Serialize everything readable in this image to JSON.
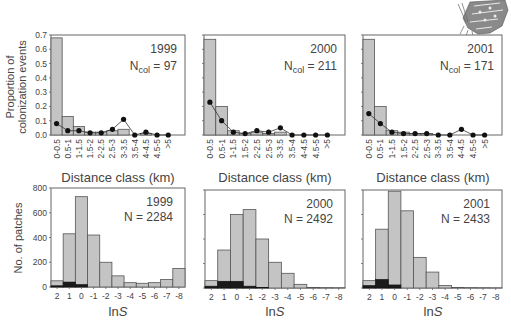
{
  "figure": {
    "top_row_ylabel_line1": "Proportion of",
    "top_row_ylabel_line2": "colonization events",
    "top_row_xlabel": "Distance class (km)",
    "bottom_row_ylabel": "No. of patches",
    "bottom_row_xlabel_prefix": "ln",
    "bottom_row_xlabel_var": "S",
    "decoration": "butterfly-illustration"
  },
  "chart_data": [
    {
      "type": "bar",
      "title": "1999",
      "annotation": "N_col = 97",
      "annotation_main": "N",
      "annotation_sub": "col",
      "annotation_value": "= 97",
      "xlabel": "Distance class (km)",
      "ylabel": "Proportion of colonization events",
      "ylim": [
        0,
        0.7
      ],
      "yticks": [
        "0.0",
        "0.1",
        "0.2",
        "0.3",
        "0.4",
        "0.5",
        "0.6",
        "0.7"
      ],
      "categories": [
        "0-0.5",
        "0.5-1",
        "1-1.5",
        "1.5-2",
        "2-2.5",
        "2.5-3",
        "3-3.5",
        "3.5-4",
        "4-4.5",
        "4.5-5",
        ">5"
      ],
      "series": [
        {
          "name": "observed colonizations (bars)",
          "values": [
            0.68,
            0.13,
            0.06,
            0.02,
            0.02,
            0.03,
            0.04,
            0.0,
            0.01,
            0.0,
            0.0
          ]
        },
        {
          "name": "expected (line with dots)",
          "values": [
            0.08,
            0.03,
            0.03,
            0.015,
            0.015,
            0.04,
            0.11,
            0.0,
            0.02,
            0.0,
            0.0
          ]
        }
      ]
    },
    {
      "type": "bar",
      "title": "2000",
      "annotation": "N_col = 211",
      "annotation_main": "N",
      "annotation_sub": "col",
      "annotation_value": "= 211",
      "xlabel": "Distance class (km)",
      "ylim": [
        0,
        0.7
      ],
      "categories": [
        "0-0.5",
        "0.5-1",
        "1-1.5",
        "1.5-2",
        "2-2.5",
        "2.5-3",
        "3-3.5",
        "3.5-4",
        "4-4.5",
        "4.5-5",
        ">5"
      ],
      "series": [
        {
          "name": "observed colonizations (bars)",
          "values": [
            0.67,
            0.2,
            0.03,
            0.01,
            0.02,
            0.01,
            0.02,
            0.0,
            0.0,
            0.0,
            0.0
          ]
        },
        {
          "name": "expected (line with dots)",
          "values": [
            0.23,
            0.1,
            0.02,
            0.01,
            0.03,
            0.02,
            0.05,
            0.0,
            0.0,
            0.0,
            0.0
          ]
        }
      ]
    },
    {
      "type": "bar",
      "title": "2001",
      "annotation": "N_col = 171",
      "annotation_main": "N",
      "annotation_sub": "col",
      "annotation_value": "= 171",
      "xlabel": "Distance class (km)",
      "ylim": [
        0,
        0.7
      ],
      "categories": [
        "0-0.5",
        "0.5-1",
        "1-1.5",
        "1.5-2",
        "2-2.5",
        "2.5-3",
        "3-3.5",
        "3.5-4",
        "4-4.5",
        "4.5-5",
        ">5"
      ],
      "series": [
        {
          "name": "observed colonizations (bars)",
          "values": [
            0.67,
            0.2,
            0.03,
            0.02,
            0.01,
            0.01,
            0.0,
            0.0,
            0.0,
            0.0,
            0.0
          ]
        },
        {
          "name": "expected (line with dots)",
          "values": [
            0.15,
            0.08,
            0.02,
            0.01,
            0.01,
            0.01,
            0.0,
            0.0,
            0.04,
            0.0,
            0.0
          ]
        }
      ]
    },
    {
      "type": "bar",
      "stacked": true,
      "title": "1999",
      "annotation": "N = 2284",
      "xlabel": "lnS",
      "ylabel": "No. of patches",
      "ylim": [
        0,
        800
      ],
      "yticks": [
        "0",
        "200",
        "400",
        "600",
        "800"
      ],
      "categories": [
        "2",
        "1",
        "0",
        "-1",
        "-2",
        "-3",
        "-4",
        "-5",
        "-6",
        "-7",
        "-8"
      ],
      "series": [
        {
          "name": "all patches (grey)",
          "values": [
            50,
            430,
            730,
            420,
            200,
            90,
            35,
            30,
            35,
            60,
            150
          ]
        },
        {
          "name": "colonized/occupied (black)",
          "values": [
            10,
            40,
            20,
            0,
            0,
            0,
            0,
            0,
            0,
            0,
            0
          ]
        }
      ]
    },
    {
      "type": "bar",
      "stacked": true,
      "title": "2000",
      "annotation": "N = 2492",
      "xlabel": "lnS",
      "ylim": [
        0,
        800
      ],
      "categories": [
        "2",
        "1",
        "0",
        "-1",
        "-2",
        "-3",
        "-4",
        "-5",
        "-6",
        "-7",
        "-8"
      ],
      "series": [
        {
          "name": "all patches (grey)",
          "values": [
            60,
            310,
            600,
            640,
            400,
            210,
            120,
            30,
            5,
            3,
            2
          ]
        },
        {
          "name": "colonized/occupied (black)",
          "values": [
            15,
            55,
            55,
            15,
            5,
            0,
            0,
            0,
            0,
            0,
            0
          ]
        }
      ]
    },
    {
      "type": "bar",
      "stacked": true,
      "title": "2001",
      "annotation": "N = 2433",
      "xlabel": "lnS",
      "ylim": [
        0,
        800
      ],
      "categories": [
        "2",
        "1",
        "0",
        "-1",
        "-2",
        "-3",
        "-4",
        "-5",
        "-6",
        "-7",
        "-8"
      ],
      "series": [
        {
          "name": "all patches (grey)",
          "values": [
            60,
            480,
            790,
            630,
            250,
            130,
            20,
            5,
            3,
            2,
            1
          ]
        },
        {
          "name": "colonized/occupied (black)",
          "values": [
            20,
            70,
            25,
            0,
            0,
            0,
            0,
            0,
            0,
            0,
            0
          ]
        }
      ]
    }
  ]
}
